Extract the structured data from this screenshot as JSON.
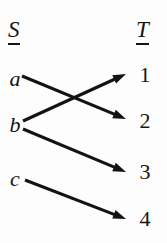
{
  "diagram": {
    "type": "function-mapping",
    "background_color": "#fdfdfd",
    "ink_color": "#131313",
    "sets": {
      "domain": {
        "name": "S",
        "label_underlined": true,
        "elements": [
          {
            "id": "a",
            "label": "a",
            "style": "italic"
          },
          {
            "id": "b",
            "label": "b",
            "style": "italic"
          },
          {
            "id": "c",
            "label": "c",
            "style": "italic"
          }
        ]
      },
      "codomain": {
        "name": "T",
        "label_underlined": true,
        "elements": [
          {
            "id": "1",
            "label": "1",
            "style": "upright"
          },
          {
            "id": "2",
            "label": "2",
            "style": "upright"
          },
          {
            "id": "3",
            "label": "3",
            "style": "upright"
          },
          {
            "id": "4",
            "label": "4",
            "style": "upright"
          }
        ]
      }
    },
    "arrows": [
      {
        "id": "arrow-a-2",
        "from": "a",
        "to": "2",
        "x1": 22,
        "y1": 76,
        "x2": 126,
        "y2": 119
      },
      {
        "id": "arrow-b-1",
        "from": "b",
        "to": "1",
        "x1": 23,
        "y1": 121,
        "x2": 126,
        "y2": 74
      },
      {
        "id": "arrow-b-3",
        "from": "b",
        "to": "3",
        "x1": 23,
        "y1": 129,
        "x2": 126,
        "y2": 172
      },
      {
        "id": "arrow-c-4",
        "from": "c",
        "to": "4",
        "x1": 25,
        "y1": 180,
        "x2": 126,
        "y2": 219
      }
    ]
  }
}
